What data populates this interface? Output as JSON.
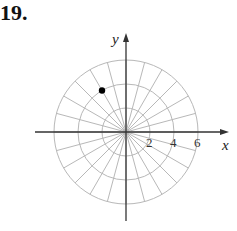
{
  "problem": {
    "number": "19."
  },
  "diagram": {
    "type": "polar-grid",
    "center_px": [
      126,
      132
    ],
    "px_per_unit": 12,
    "circle_radii": [
      2,
      4,
      6
    ],
    "radial_line_spacing_deg": 15,
    "grid_color": "#b8b8b8",
    "axis_color": "#333333",
    "axes": {
      "x_label": "x",
      "y_label": "y"
    },
    "tick_labels": [
      {
        "value": 2,
        "text": "2"
      },
      {
        "value": 4,
        "text": "4"
      },
      {
        "value": 6,
        "text": "6"
      }
    ],
    "points": [
      {
        "r": 4,
        "theta_deg": 120,
        "color": "#000000"
      }
    ]
  }
}
